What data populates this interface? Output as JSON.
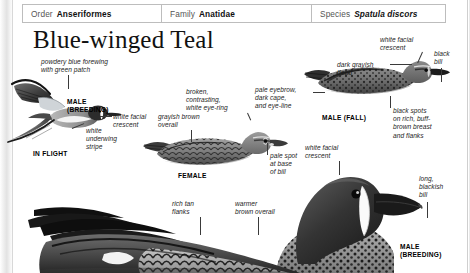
{
  "page": {
    "title": "Blue-winged Teal",
    "taxonomy": [
      {
        "key": "Order",
        "value": "Anseriformes",
        "italic": false
      },
      {
        "key": "Family",
        "value": "Anatidae",
        "italic": false
      },
      {
        "key": "Species",
        "value": "Spatula discors",
        "italic": true
      }
    ]
  },
  "annotations": {
    "powdery_forewing": "powdery blue forewing\nwith green patch",
    "white_facial_crescent_flight": "white facial\ncrescent",
    "white_underwing_stripe": "white\nunderwing\nstripe",
    "broken_eye_ring": "broken,\ncontrasting,\nwhite eye-ring",
    "grayish_brown_overall": "grayish brown\noverall",
    "pale_spot_bill": "pale spot\nat base\nof bill",
    "pale_eyebrow": "pale eyebrow,\ndark cape,\nand eye-line",
    "white_facial_crescent_fall": "white facial\ncrescent",
    "black_bill": "black\nbill",
    "dark_grayish_head": "dark grayish\nhead",
    "black_spots": "black spots\non rich, buff-\nbrown breast\nand flanks",
    "white_facial_crescent_breeding": "white facial\ncrescent",
    "long_blackish_bill": "long,\nblackish\nbill",
    "rich_tan_flanks": "rich tan\nflanks",
    "warmer_brown_overall": "warmer\nbrown overall"
  },
  "plate_labels": {
    "male_breeding_flight": "MALE\n(BREEDING)",
    "in_flight": "IN FLIGHT",
    "female": "FEMALE",
    "male_fall": "MALE (FALL)",
    "male_breeding_large": "MALE\n(BREEDING)"
  },
  "colors": {
    "page_background": "#ffffff",
    "rule": "#bdbdbd",
    "text": "#1d1d1d",
    "title": "#111111",
    "leader": "#3a3a3a",
    "plumage_dark": "#2a2a2a",
    "plumage_mid": "#7d7d7d",
    "plumage_light": "#c9c9c9"
  }
}
